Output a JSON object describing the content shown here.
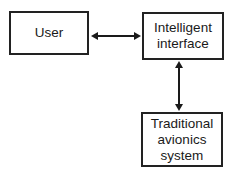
{
  "diagram": {
    "nodes": [
      {
        "id": "user",
        "label": "User"
      },
      {
        "id": "intelligent-interface",
        "label": "Intelligent\ninterface"
      },
      {
        "id": "traditional-avionics",
        "label": "Traditional\navionics\nsystem"
      }
    ],
    "edges": [
      {
        "from": "user",
        "to": "intelligent-interface",
        "direction": "bidirectional"
      },
      {
        "from": "intelligent-interface",
        "to": "traditional-avionics",
        "direction": "bidirectional"
      }
    ]
  }
}
